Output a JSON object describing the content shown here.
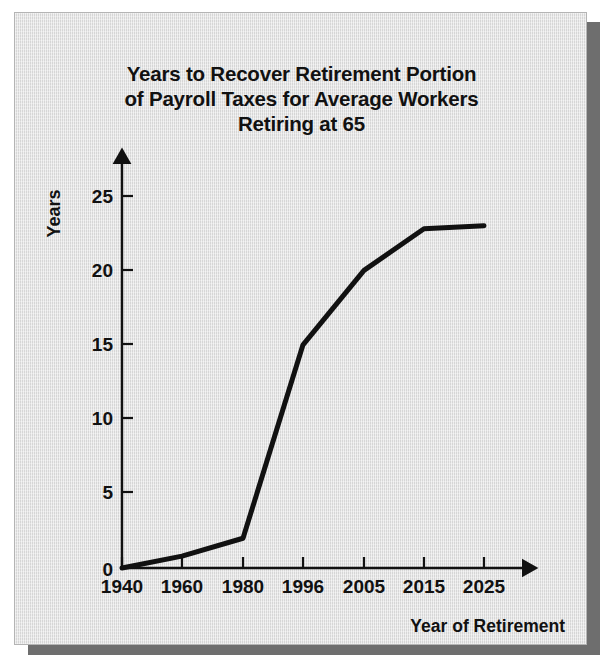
{
  "figure": {
    "title_lines": [
      "Years to Recover Retirement Portion",
      "of Payroll Taxes for Average Workers",
      "Retiring at 65"
    ],
    "background_color": "#dddddd",
    "line_color": "#111111",
    "shadow_color": "#6e6e6e"
  },
  "chart_data": {
    "type": "line",
    "title": "Years to Recover Retirement Portion of Payroll Taxes for Average Workers Retiring at 65",
    "xlabel": "Year of Retirement",
    "ylabel": "Years",
    "categories": [
      "1940",
      "1960",
      "1980",
      "1996",
      "2005",
      "2015",
      "2025"
    ],
    "x": [
      1940,
      1960,
      1980,
      1996,
      2005,
      2015,
      2025
    ],
    "values": [
      0,
      0.8,
      2,
      15,
      20,
      22.8,
      23
    ],
    "series": [
      {
        "name": "Years to recover retirement portion of payroll taxes",
        "values": [
          0,
          0.8,
          2,
          15,
          20,
          22.8,
          23
        ]
      }
    ],
    "ylim": [
      0,
      26.5
    ],
    "yticks": [
      0,
      5,
      10,
      15,
      20,
      25
    ],
    "ytick_labels": [
      "0",
      "5",
      "10",
      "15",
      "20",
      "25"
    ],
    "xtick_labels": [
      "1940",
      "1960",
      "1980",
      "1996",
      "2005",
      "2015",
      "2025"
    ],
    "grid": false,
    "legend": false,
    "axis_arrows": true,
    "line_width_px": 5
  }
}
